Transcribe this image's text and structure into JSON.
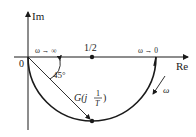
{
  "diagram": {
    "type": "nyquist-plot",
    "axes": {
      "imag_label": "Im",
      "real_label": "Re",
      "origin_label": "0"
    },
    "markers": {
      "half_label": "1/2"
    },
    "annotations": {
      "omega_inf": "ω → ∞",
      "omega_zero": "ω → 0",
      "angle": "45°",
      "point_label_prefix": "G(j",
      "point_label_num": "1",
      "point_label_den": "T",
      "point_label_suffix": ")",
      "direction": "ω"
    },
    "colors": {
      "stroke": "#1a1a1a",
      "text": "#222222"
    }
  }
}
